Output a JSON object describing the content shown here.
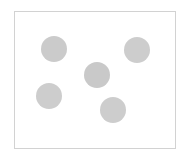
{
  "canvas": {
    "width": 188,
    "height": 161,
    "background_color": "#ffffff"
  },
  "panel": {
    "name": "plot-frame",
    "x": 14,
    "y": 11,
    "width": 162,
    "height": 138,
    "background_color": "#ffffff",
    "border_color": "#d2d2d2",
    "border_width": 1
  },
  "chart_data": {
    "type": "scatter",
    "title": "",
    "subtitle": "",
    "xlabel": "",
    "ylabel": "",
    "xlim": [
      14,
      176
    ],
    "ylim": [
      11,
      149
    ],
    "grid": false,
    "legend": null,
    "axis_ticks": [],
    "tick_labels": [],
    "annotations": [],
    "marker": {
      "shape": "circle",
      "fill_color": "#cccccc",
      "edge_color": "#cccccc",
      "diameter": 26,
      "radius": 13
    },
    "point_count": 5,
    "points": [
      {
        "id": "dot-1",
        "label": "",
        "cx": 54,
        "cy": 49,
        "r": 13,
        "color": "#cbcbcb"
      },
      {
        "id": "dot-2",
        "label": "",
        "cx": 137,
        "cy": 50,
        "r": 13,
        "color": "#cdcdcd"
      },
      {
        "id": "dot-3",
        "label": "",
        "cx": 97,
        "cy": 75,
        "r": 13,
        "color": "#c9c9c9"
      },
      {
        "id": "dot-4",
        "label": "",
        "cx": 49,
        "cy": 96,
        "r": 13,
        "color": "#cdcdcd"
      },
      {
        "id": "dot-5",
        "label": "",
        "cx": 113,
        "cy": 110,
        "r": 13,
        "color": "#cdcdcd"
      }
    ],
    "x": [
      54,
      137,
      97,
      49,
      113
    ],
    "y": [
      49,
      50,
      75,
      96,
      110
    ],
    "values": [
      13,
      13,
      13,
      13,
      13
    ]
  },
  "caption": {
    "text": ""
  }
}
